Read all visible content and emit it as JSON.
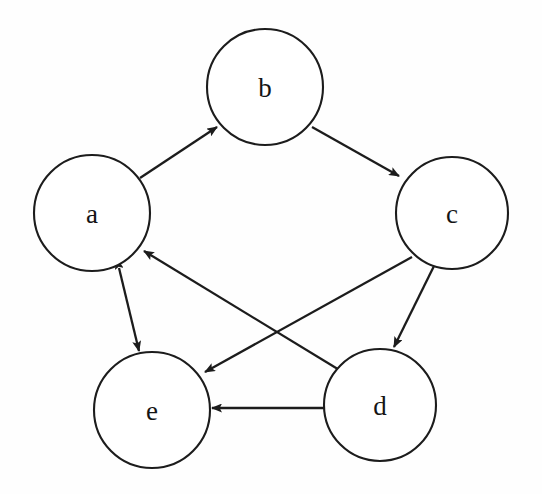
{
  "diagram": {
    "type": "directed-graph",
    "background_color": "#fefefe",
    "stroke_color": "#1c1c1c",
    "label_color": "#141414",
    "nodes": [
      {
        "id": "a",
        "label": "a",
        "cx": 92,
        "cy": 213,
        "r": 58
      },
      {
        "id": "b",
        "label": "b",
        "cx": 265,
        "cy": 87,
        "r": 58
      },
      {
        "id": "c",
        "label": "c",
        "cx": 452,
        "cy": 213,
        "r": 56
      },
      {
        "id": "d",
        "label": "d",
        "cx": 380,
        "cy": 405,
        "r": 56
      },
      {
        "id": "e",
        "label": "e",
        "cx": 152,
        "cy": 410,
        "r": 58
      }
    ],
    "edges": [
      {
        "id": "a-to-b",
        "from": "a",
        "to": "b",
        "direction": "forward",
        "x1": 140,
        "y1": 178,
        "x2": 217,
        "y2": 127
      },
      {
        "id": "b-to-c",
        "from": "b",
        "to": "c",
        "direction": "forward",
        "x1": 312,
        "y1": 127,
        "x2": 399,
        "y2": 176
      },
      {
        "id": "c-to-d",
        "from": "c",
        "to": "d",
        "direction": "forward",
        "x1": 434,
        "y1": 266,
        "x2": 394,
        "y2": 347
      },
      {
        "id": "c-to-e",
        "from": "c",
        "to": "e",
        "direction": "forward",
        "x1": 412,
        "y1": 257,
        "x2": 205,
        "y2": 372
      },
      {
        "id": "d-to-a",
        "from": "d",
        "to": "a",
        "direction": "forward",
        "x1": 341,
        "y1": 371,
        "x2": 144,
        "y2": 251
      },
      {
        "id": "d-to-e",
        "from": "d",
        "to": "e",
        "direction": "forward",
        "x1": 324,
        "y1": 408,
        "x2": 212,
        "y2": 408
      },
      {
        "id": "a-and-e",
        "from": "a",
        "to": "e",
        "direction": "bidirectional",
        "x1": 119,
        "y1": 268,
        "x2": 139,
        "y2": 351
      }
    ],
    "adjacency_summary": [
      "a → b",
      "b → c",
      "c → d",
      "c → e",
      "d → a",
      "d → e",
      "a ↔ e"
    ]
  }
}
